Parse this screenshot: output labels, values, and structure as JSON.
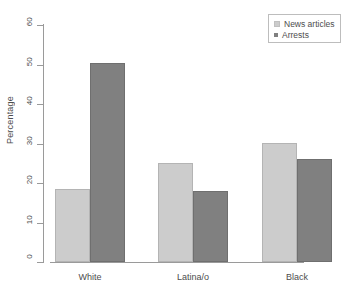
{
  "chart_data": {
    "type": "bar",
    "title": "",
    "subtitle": "",
    "xlabel": "",
    "ylabel": "Percentage",
    "categories": [
      "White",
      "Latina/o",
      "Black"
    ],
    "series": [
      {
        "name": "News articles",
        "color": "#cccccc",
        "values": [
          18.4,
          25.1,
          30.2
        ]
      },
      {
        "name": "Arrests",
        "color": "#808080",
        "values": [
          50.3,
          18.0,
          26.1
        ]
      }
    ],
    "ylim": [
      0,
      60
    ],
    "yticks": [
      0,
      10,
      20,
      30,
      40,
      50,
      60
    ],
    "ytick_labels": [
      "0",
      "10",
      "20",
      "30",
      "40",
      "50",
      "60"
    ],
    "grid": false,
    "legend_position": "top-right",
    "bar_mode": "grouped",
    "annotations": []
  },
  "legend": {
    "entries": [
      {
        "label": "News articles",
        "swatch": "legend-swatch-news-articles"
      },
      {
        "label": "Arrests",
        "swatch": "legend-swatch-arrests"
      }
    ]
  },
  "axes": {
    "y_title": "Percentage"
  }
}
